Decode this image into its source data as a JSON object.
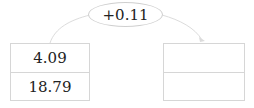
{
  "operation": {
    "label": "+0.11"
  },
  "left_box": {
    "values": [
      "4.09",
      "18.79"
    ]
  },
  "right_box": {
    "values": [
      "",
      ""
    ]
  },
  "colors": {
    "wire": "#dcdcdc",
    "border": "#d6d6d6"
  }
}
